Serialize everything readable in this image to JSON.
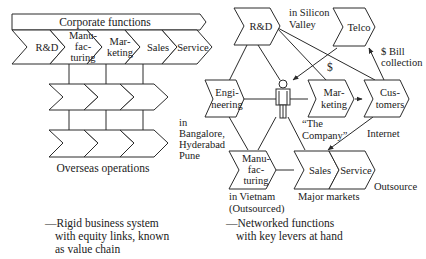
{
  "left_diagram": {
    "title": "Corporate functions",
    "chain": [
      {
        "lines": [
          "R&D"
        ]
      },
      {
        "lines": [
          "Manu-",
          "fac-",
          "turing"
        ]
      },
      {
        "lines": [
          "Mar-",
          "keting"
        ]
      },
      {
        "lines": [
          "Sales"
        ]
      },
      {
        "lines": [
          "Service"
        ]
      }
    ],
    "overseas_label": "Overseas operations",
    "caption": [
      "—Rigid business system",
      "with equity links, known",
      "as value chain"
    ]
  },
  "right_diagram": {
    "nodes": {
      "rnd": {
        "lines": [
          "R&D"
        ]
      },
      "telco": {
        "lines": [
          "Telco"
        ]
      },
      "engineering": {
        "lines": [
          "Engi-",
          "neering"
        ]
      },
      "marketing": {
        "lines": [
          "Mar-",
          "keting"
        ]
      },
      "customers": {
        "lines": [
          "Cus-",
          "tomers"
        ]
      },
      "manufacturing": {
        "lines": [
          "Manu-",
          "fac-",
          "turing"
        ]
      },
      "sales": {
        "lines": [
          "Sales"
        ]
      },
      "service": {
        "lines": [
          "Service"
        ]
      }
    },
    "labels": {
      "silicon_valley": [
        "in Silicon",
        "Valley"
      ],
      "dollar": "$",
      "bill_collection": [
        "$ Bill",
        "collection"
      ],
      "company": [
        "“The",
        "Company”"
      ],
      "internet": "Internet",
      "bangalore": [
        "in",
        "Bangalore,",
        "Hyderabad",
        "Pune"
      ],
      "vietnam": [
        "in Vietnam",
        "(Outsourced)"
      ],
      "major_markets": "Major markets",
      "outsource": "Outsource"
    },
    "center_icon": "person-icon",
    "caption": [
      "—Networked functions",
      "with key levers at hand"
    ]
  }
}
